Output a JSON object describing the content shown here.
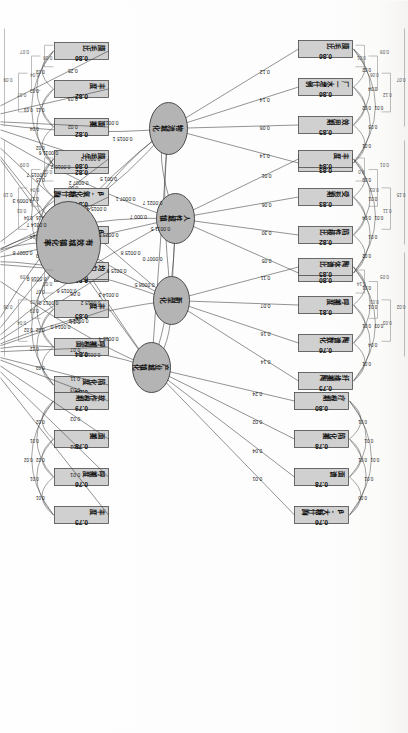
{
  "figure": {
    "type": "sem-path-diagram",
    "orientation": "rotated-90",
    "center_latent": "有效城镇化率"
  },
  "latents": [
    {
      "id": "L1",
      "label": "物流城化",
      "x": 128,
      "y": 240,
      "rx": 26,
      "ry": 19
    },
    {
      "id": "L2",
      "label": "人性城镇",
      "x": 218,
      "y": 233,
      "rx": 25,
      "ry": 19
    },
    {
      "id": "L3",
      "label": "新型化",
      "x": 300,
      "y": 237,
      "rx": 24,
      "ry": 18
    },
    {
      "id": "L4",
      "label": "产业城镇化",
      "x": 367,
      "y": 257,
      "rx": 25,
      "ry": 19
    },
    {
      "id": "L5",
      "label": "全域",
      "x": 120,
      "y": 437,
      "rx": 24,
      "ry": 18
    },
    {
      "id": "L6",
      "label": "绿色",
      "x": 262,
      "y": 435,
      "rx": 24,
      "ry": 18
    },
    {
      "id": "L7",
      "label": "集约",
      "x": 352,
      "y": 428,
      "rx": 24,
      "ry": 18
    },
    {
      "id": "L8",
      "label": "有效城镇化率",
      "x": 242,
      "y": 340,
      "rx": 41,
      "ry": 32
    }
  ],
  "indicator_groups": [
    {
      "latent": "L1",
      "loadings": [
        "0.12",
        "0.14",
        "0.06",
        "0.14"
      ],
      "items": [
        {
          "name": "膜毛比",
          "value": "0.86"
        },
        {
          "name": "厂一水增什例",
          "value": "0.86"
        },
        {
          "name": "效用期",
          "value": "0.85"
        },
        {
          "name": "有何度",
          "value": "0.83"
        }
      ],
      "arcs": [
        "0.02",
        "0.04",
        "0.01",
        "0.02",
        "0.05",
        "0.01"
      ]
    },
    {
      "latent": "L2",
      "loadings": [
        "0.01",
        "0.06",
        "0.30",
        "0.05"
      ],
      "items": [
        {
          "name": "丰度",
          "value": "0.84"
        },
        {
          "name": "受形期",
          "value": "0.83"
        },
        {
          "name": "陷性棱比",
          "value": "0.82"
        },
        {
          "name": "陷叶期",
          "value": "0.80"
        }
      ],
      "arcs": [
        "0.03",
        "0.01",
        "0.01",
        "0.04",
        "0.01",
        "0.02"
      ]
    },
    {
      "latent": "L3",
      "loadings": [
        "0.11",
        "0.07",
        "0.16",
        "0.14"
      ],
      "items": [
        {
          "name": "陶体谱比",
          "value": "0.85"
        },
        {
          "name": "呼搬度",
          "value": "0.81"
        },
        {
          "name": "陶谱数化",
          "value": "0.76"
        },
        {
          "name": "纤维搬陶",
          "value": "0.75"
        }
      ],
      "arcs": [
        "0.01",
        "0.01",
        "0.03",
        "0.01",
        "0.04",
        "0.01"
      ]
    },
    {
      "latent": "L4",
      "loadings": [
        "0.24",
        "0.02",
        "0.04",
        "0.01"
      ],
      "items": [
        {
          "name": "疗根期",
          "value": "0.80"
        },
        {
          "name": "陷化搬",
          "value": "0.78"
        },
        {
          "name": "面谱",
          "value": "0.78"
        },
        {
          "name": "β-大糖什胸",
          "value": "0.76"
        }
      ],
      "arcs": [
        "0.01",
        "0.01",
        "0.01",
        "0.01",
        "0.01",
        "0.00"
      ]
    },
    {
      "latent": "L5",
      "loadings": [
        "0.25",
        "0.03",
        "0.02",
        "0.04"
      ],
      "items": [
        {
          "name": "膜毛比",
          "value": "0.86"
        },
        {
          "name": "丰度",
          "value": "0.82"
        },
        {
          "name": "面搬",
          "value": "0.82"
        },
        {
          "name": "陷叶程",
          "value": "0.82"
        }
      ],
      "arcs": [
        "0.03",
        "0.03",
        "0.03",
        "0.11",
        "0.04",
        "0.02"
      ]
    },
    {
      "latent": "L6",
      "loadings": [
        "0.05",
        "0.02",
        "0.02",
        "0.07"
      ],
      "items": [
        {
          "name": "膜毛生",
          "value": "0.86"
        },
        {
          "name": "β-氧化糖什胸",
          "value": "0.84"
        },
        {
          "name": "β-大糖什胸",
          "value": "0.83"
        },
        {
          "name": "纤维搬胸",
          "value": "0.83"
        }
      ],
      "arcs": [
        "0.15",
        "0.17",
        "0.04",
        "0.16",
        "0.14",
        "0.03"
      ]
    },
    {
      "latent": "L7",
      "loadings": [
        "0.06",
        "0.04",
        "0.07",
        "0.11"
      ],
      "items": [
        {
          "name": "均匀度",
          "value": "0.86"
        },
        {
          "name": "丰度",
          "value": "0.85"
        },
        {
          "name": "呼搬根面",
          "value": "0.84"
        },
        {
          "name": "陷化度",
          "value": "0.84"
        }
      ],
      "arcs": [
        "0.07",
        "0.03",
        "0.02",
        "0.02",
        "0.12",
        "0.03"
      ]
    },
    {
      "latent": "L7b",
      "loadings": [
        "0.03",
        "0.02",
        "0.02",
        "0.01"
      ],
      "items": [
        {
          "name": "软作根期",
          "value": "0.79"
        },
        {
          "name": "面搬",
          "value": "0.78"
        },
        {
          "name": "呼搬度",
          "value": "0.76"
        },
        {
          "name": "丰度",
          "value": "0.75"
        }
      ],
      "arcs": [
        "0.02",
        "0.01",
        "0.02",
        "0.02",
        "0.01",
        "0.01"
      ]
    }
  ],
  "path_labels": [
    "0.0007 1",
    "0.000 7",
    "0.001 5",
    "0.0015 8",
    "0.0015 9",
    "0.0014 3",
    "0.0013 2",
    "0.0007 2",
    "0.0015 4",
    "0.0023 6",
    "0.0015 2",
    "0.0021 2",
    "0.0011 6",
    "0.0015 7",
    "0.0009 3",
    "0.0014 7",
    "0.0007 8",
    "0.0016 0",
    "0.0012 0",
    "0.0014 0",
    "0.0013 0",
    "0.0015 1",
    "0.0015 4",
    "0.0013 2",
    "0.0021 7",
    "0.0011 5",
    "0.0007 0",
    "0.0008 5",
    "0.0016 2",
    "0.0015 6"
  ],
  "dendrograms": [
    {
      "position": "top-left",
      "labels": [
        "0.01",
        "0.06",
        "0.12",
        "0.07",
        "0.08"
      ]
    },
    {
      "position": "top-mid",
      "labels": [
        "0.0",
        "0.03",
        "0.11",
        "0.15",
        "0.01",
        "0.05"
      ]
    },
    {
      "position": "top-right",
      "labels": [
        "0.14",
        "0.01",
        "0.03",
        "0.02",
        "0.05",
        "0.09"
      ]
    },
    {
      "position": "bottom-left",
      "labels": [
        "0.08",
        "0.04",
        "0.07",
        "0.09",
        "0.07"
      ]
    },
    {
      "position": "bottom-mid",
      "labels": [
        "0.02",
        "0.04",
        "0.03",
        "0.10",
        "0.09"
      ]
    },
    {
      "position": "bottom-right",
      "labels": [
        "0.02",
        "0.02",
        "0.04",
        "0.06",
        "0.09"
      ]
    }
  ]
}
